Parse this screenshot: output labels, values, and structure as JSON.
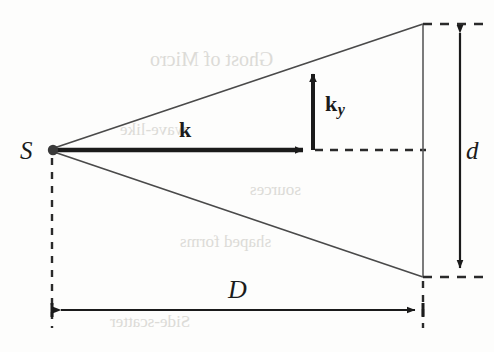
{
  "figure": {
    "kind": "physics-diagram",
    "background_color": "#fdfdfc",
    "ink_color": "#1b1b1b",
    "labels": {
      "source": "S",
      "wavevector": "k",
      "wavevector_y_base": "k",
      "wavevector_y_sub": "y",
      "distance": "D",
      "aperture": "d"
    },
    "geometry": {
      "source_point": {
        "x": 52,
        "y": 150
      },
      "upper_ray_end": {
        "x": 423,
        "y": 24
      },
      "lower_ray_end": {
        "x": 423,
        "y": 277
      },
      "k_arrow": {
        "x1": 52,
        "y1": 150,
        "x2": 311,
        "y2": 150
      },
      "ky_arrow": {
        "x1": 313,
        "y1": 150,
        "x2": 313,
        "y2": 66
      },
      "axis_dashed": {
        "x1": 313,
        "y1": 150,
        "x2": 424,
        "y2": 150
      },
      "screen_line": {
        "x": 423,
        "y1": 24,
        "y2": 277
      },
      "d_dimension": {
        "x": 460,
        "y1": 24,
        "y2": 277
      },
      "D_dimension": {
        "y": 310,
        "x1": 52,
        "x2": 424
      }
    }
  },
  "ghost_text": [
    {
      "text": "Ghost of Micro",
      "x": 150,
      "y": 60,
      "size": 20
    },
    {
      "text": "wave-like",
      "x": 120,
      "y": 130,
      "size": 17
    },
    {
      "text": "sources",
      "x": 250,
      "y": 190,
      "size": 17
    },
    {
      "text": "shaped forms",
      "x": 180,
      "y": 240,
      "size": 17
    },
    {
      "text": "Side-scatter",
      "x": 110,
      "y": 320,
      "size": 17
    }
  ]
}
